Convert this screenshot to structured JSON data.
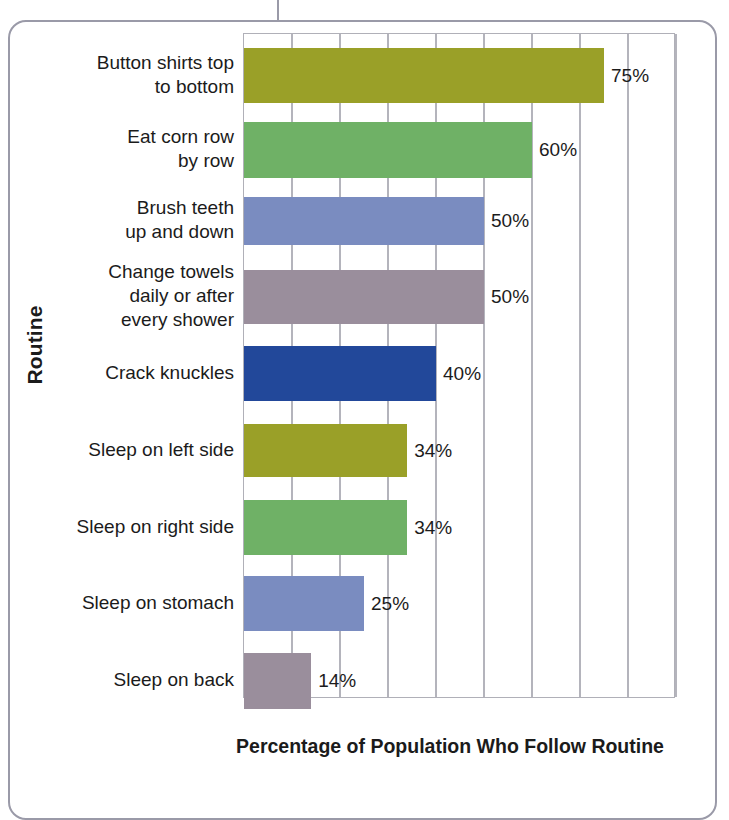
{
  "figure": {
    "frame_present": true,
    "frame_color": "#9a9aa8"
  },
  "chart_data": {
    "type": "bar",
    "orientation": "horizontal",
    "title": "",
    "xlabel": "Percentage of Population Who Follow Routine",
    "ylabel": "Routine",
    "xlim": [
      0,
      90
    ],
    "grid": true,
    "gridlines": [
      0,
      10,
      20,
      30,
      40,
      50,
      60,
      70,
      80,
      90
    ],
    "tick_labels": [],
    "legend": null,
    "categories": [
      "Button shirts top\nto bottom",
      "Eat corn row\nby row",
      "Brush teeth\nup and down",
      "Change towels\ndaily or after\nevery shower",
      "Crack knuckles",
      "Sleep on left side",
      "Sleep on right side",
      "Sleep on stomach",
      "Sleep on back"
    ],
    "values": [
      75,
      60,
      50,
      50,
      40,
      34,
      34,
      25,
      14
    ],
    "value_labels": [
      "75%",
      "60%",
      "50%",
      "50%",
      "40%",
      "34%",
      "34%",
      "25%",
      "14%"
    ],
    "colors": [
      "#9aa028",
      "#6fb166",
      "#7a8cc0",
      "#9a8e9c",
      "#22489a",
      "#9aa028",
      "#6fb166",
      "#7a8cc0",
      "#9a8e9c"
    ],
    "bars": [
      {
        "label": "Button shirts top\nto bottom",
        "value": 75,
        "value_label": "75%",
        "color": "#9aa028",
        "top": 14,
        "height": 55
      },
      {
        "label": "Eat corn row\nby row",
        "value": 60,
        "value_label": "60%",
        "color": "#6fb166",
        "top": 88,
        "height": 56
      },
      {
        "label": "Brush teeth\nup and down",
        "value": 50,
        "value_label": "50%",
        "color": "#7a8cc0",
        "top": 163,
        "height": 48
      },
      {
        "label": "Change towels\ndaily or after\nevery shower",
        "value": 50,
        "value_label": "50%",
        "color": "#9a8e9c",
        "top": 236,
        "height": 54
      },
      {
        "label": "Crack knuckles",
        "value": 40,
        "value_label": "40%",
        "color": "#22489a",
        "top": 312,
        "height": 55
      },
      {
        "label": "Sleep on left side",
        "value": 34,
        "value_label": "34%",
        "color": "#9aa028",
        "top": 390,
        "height": 53
      },
      {
        "label": "Sleep on right side",
        "value": 34,
        "value_label": "34%",
        "color": "#6fb166",
        "top": 466,
        "height": 55
      },
      {
        "label": "Sleep on stomach",
        "value": 25,
        "value_label": "25%",
        "color": "#7a8cc0",
        "top": 542,
        "height": 55
      },
      {
        "label": "Sleep on back",
        "value": 14,
        "value_label": "14%",
        "color": "#9a8e9c",
        "top": 619,
        "height": 56
      }
    ]
  }
}
